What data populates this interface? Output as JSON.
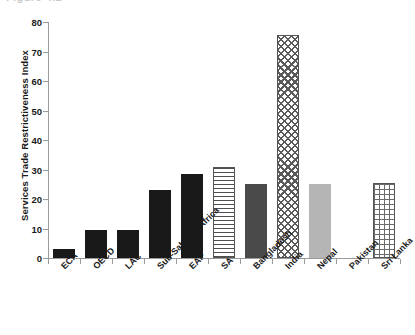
{
  "figure": {
    "clipped_caption": "Figure 4.2",
    "y_axis_title": "Services Trade Restrictiveness Index"
  },
  "chart_data": {
    "type": "bar",
    "title": "",
    "xlabel": "",
    "ylabel": "Services Trade Restrictiveness Index",
    "ylim": [
      0,
      80
    ],
    "yticks": [
      0,
      10,
      20,
      30,
      40,
      50,
      60,
      70,
      80
    ],
    "ytick_labels": [
      "0",
      "10",
      "20",
      "30",
      "40",
      "50",
      "60",
      "70",
      "80"
    ],
    "grid": false,
    "legend": "none",
    "categories": [
      "ECA",
      "OECD",
      "LAC",
      "Sub-Saharan Africa",
      "EAP",
      "SA",
      "Bangladesh",
      "India",
      "Nepal",
      "Pakistan",
      "Sri Lanka"
    ],
    "values": [
      3,
      9.5,
      9.5,
      23,
      28.5,
      31,
      25,
      75.5,
      25,
      0,
      25.5
    ],
    "bar_styles": [
      "solid-black",
      "solid-black",
      "solid-black",
      "solid-black",
      "solid-black",
      "hlines",
      "dark-gray",
      "crosshatch",
      "light-gray",
      "none",
      "grid"
    ],
    "colors": {
      "solid_black": "#191919",
      "dark_gray": "#4a4a4a",
      "light_gray": "#b5b5b5",
      "hatch_line": "#5a5a5a",
      "axis": "#9a9a9a",
      "background": "#ffffff"
    }
  }
}
